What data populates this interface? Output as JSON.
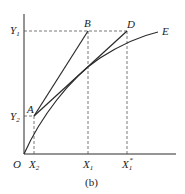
{
  "diagram": {
    "caption": "(b)",
    "colors": {
      "line": "#2a2a2a",
      "dashed": "#555555",
      "background": "#ffffff"
    },
    "axes": {
      "origin_label": "O",
      "y_ticks": [
        {
          "label": "Y",
          "sub": "1"
        },
        {
          "label": "Y",
          "sub": "2"
        }
      ],
      "x_ticks": [
        {
          "label": "X",
          "sub": "2"
        },
        {
          "label": "X",
          "sub": "1"
        },
        {
          "label": "X",
          "sub": "1",
          "sup": "*"
        }
      ]
    },
    "points": {
      "A": "A",
      "B": "B",
      "D": "D",
      "E": "E"
    },
    "elements": [
      "Concave curve from O to E",
      "Line segment A to B",
      "Line segment A to D",
      "Dashed horizontal line from Y1 to D",
      "Dashed vertical lines at X2, X1, X1*",
      "Dashed horizontal line Y2 to A"
    ]
  }
}
